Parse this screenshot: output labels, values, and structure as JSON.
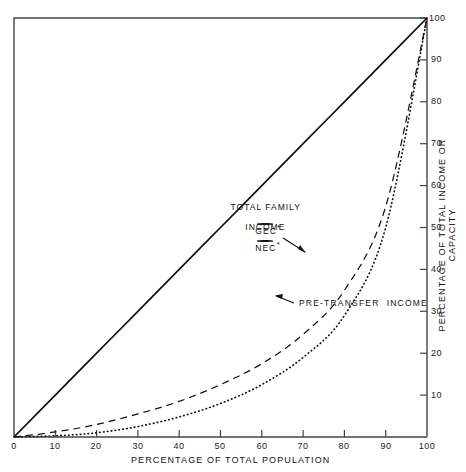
{
  "figure": {
    "type": "lorenz-curve-chart",
    "background": "#ffffff",
    "ink_color": "#111111"
  },
  "axes": {
    "x_title": "PERCENTAGE OF TOTAL POPULATION",
    "y_title": "PERCENTAGE OF TOTAL INCOME OR CAPACITY",
    "x_ticks": [
      "0",
      "10",
      "20",
      "30",
      "40",
      "50",
      "60",
      "70",
      "80",
      "90",
      "100"
    ],
    "y_ticks": [
      "10",
      "20",
      "30",
      "40",
      "50",
      "60",
      "70",
      "80",
      "90",
      "100"
    ],
    "x_range": [
      0,
      100
    ],
    "y_range": [
      0,
      100
    ],
    "y_axis_position": "right",
    "grid": false
  },
  "annotations": [
    {
      "name": "total-family-income",
      "line1": "TOTAL FAMILY",
      "line2": "INCOME",
      "x": 250,
      "y": 196
    },
    {
      "name": "gec-label",
      "text": "GEC",
      "marker": "*",
      "x": 261,
      "y": 217
    },
    {
      "name": "nec-label",
      "text": "NEC",
      "marker": "*",
      "x": 261,
      "y": 234
    },
    {
      "name": "pre-transfer-income",
      "text": "PRE-TRANSFER  INCOME",
      "x": 297,
      "y": 303
    }
  ],
  "chart_data": {
    "type": "line",
    "title": "",
    "xlabel": "PERCENTAGE OF TOTAL POPULATION",
    "ylabel": "PERCENTAGE OF TOTAL INCOME OR CAPACITY",
    "xlim": [
      0,
      100
    ],
    "ylim": [
      0,
      100
    ],
    "grid": false,
    "legend_position": "in-plot-annotations",
    "x": [
      0,
      10,
      20,
      30,
      40,
      50,
      60,
      70,
      80,
      90,
      100
    ],
    "series": [
      {
        "name": "Line of equality",
        "style": "solid",
        "color": "#111111",
        "values": [
          0,
          10,
          20,
          30,
          40,
          50,
          60,
          70,
          80,
          90,
          100
        ]
      },
      {
        "name": "Total family income (GEC*, NEC*)",
        "style": "dashed",
        "color": "#111111",
        "values": [
          0,
          1.2,
          3.0,
          5.5,
          8.5,
          12.5,
          17.5,
          24.5,
          35.0,
          55.0,
          100
        ]
      },
      {
        "name": "Pre-transfer income",
        "style": "dotted",
        "color": "#111111",
        "values": [
          0,
          0.3,
          1.0,
          2.5,
          4.8,
          8.0,
          12.5,
          19.0,
          29.0,
          50.0,
          100
        ]
      }
    ]
  }
}
